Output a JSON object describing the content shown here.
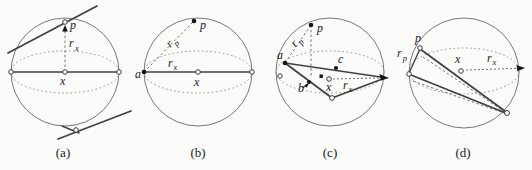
{
  "figure": {
    "background": "#fbfbf9",
    "ink": "#404040",
    "sphere_outline_color": "#787878",
    "panels": [
      {
        "caption": "(a)",
        "labels": {
          "p": "p",
          "x": "x",
          "rx_base": "r",
          "rx_sub": "x"
        }
      },
      {
        "caption": "(b)",
        "labels": {
          "p": "p",
          "x": "x",
          "a": "a",
          "rp_base": "r",
          "rp_sub": "p",
          "rx_base": "r",
          "rx_sub": "x"
        }
      },
      {
        "caption": "(c)",
        "labels": {
          "p": "p",
          "x": "x",
          "a": "a",
          "b": "b",
          "c": "c",
          "rp_base": "r",
          "rp_sub": "p",
          "rx_base": "r",
          "rx_sub": "x"
        }
      },
      {
        "caption": "(d)",
        "labels": {
          "p": "p",
          "x": "x",
          "rp_base": "r",
          "rp_sub": "p",
          "rx_base": "r",
          "rx_sub": "x"
        }
      }
    ]
  }
}
